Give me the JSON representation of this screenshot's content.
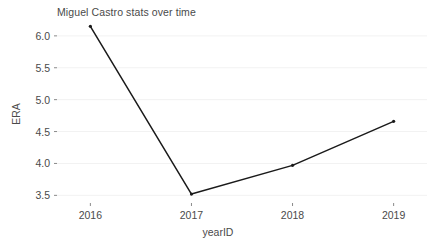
{
  "chart_data": {
    "type": "line",
    "title": "Miguel Castro stats over time",
    "xlabel": "yearID",
    "ylabel": "ERA",
    "categories": [
      2016,
      2017,
      2018,
      2019
    ],
    "x": [
      2016,
      2017,
      2018,
      2019
    ],
    "values": [
      6.15,
      3.52,
      3.97,
      4.66
    ],
    "series": [
      {
        "name": "ERA",
        "values": [
          6.15,
          3.52,
          3.97,
          4.66
        ]
      }
    ],
    "xtick_labels": [
      "2016",
      "2017",
      "2018",
      "2019"
    ],
    "ytick_labels": [
      "3.5",
      "4.0",
      "4.5",
      "5.0",
      "5.5",
      "6.0"
    ],
    "ytick_values": [
      3.5,
      4.0,
      4.5,
      5.0,
      5.5,
      6.0
    ],
    "ylim": [
      3.38,
      6.28
    ],
    "xlim": [
      2015.67,
      2019.33
    ],
    "grid": "horizontal",
    "legend": "none",
    "line_color": "#1a1a1a",
    "marker_color": "#1a1a1a",
    "grid_color": "#f2f2f2",
    "background_color": "#ffffff",
    "text_color": "#4a4a4a"
  }
}
